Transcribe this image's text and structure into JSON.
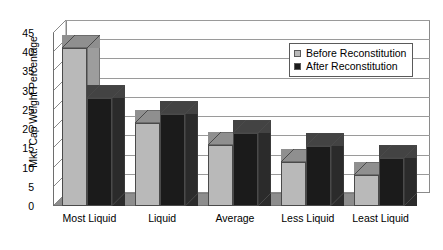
{
  "chart_data": {
    "type": "bar",
    "title": "",
    "subtitle": "",
    "xlabel": "",
    "ylabel": "Mkt. Cap Weight Percentage",
    "categories": [
      "Most Liquid",
      "Liquid",
      "Average",
      "Less Liquid",
      "Least Liquid"
    ],
    "series": [
      {
        "name": "Before Reconstitution",
        "color": "#b9b9b9",
        "values": [
          41,
          21.5,
          16,
          11.5,
          8
        ]
      },
      {
        "name": "After Reconstitution",
        "color": "#1b1b1b",
        "values": [
          28,
          24,
          19,
          15.5,
          12.5
        ]
      }
    ],
    "ylim": [
      0,
      45
    ],
    "ytick_step": 5,
    "yticks": [
      "0",
      "5",
      "10",
      "15",
      "20",
      "25",
      "30",
      "35",
      "40",
      "45"
    ],
    "grid": true,
    "grid_axis": "y",
    "legend_position": "top-right",
    "style": "3d-column"
  },
  "legend": {
    "items": [
      {
        "label": "Before Reconstitution",
        "swatch": "#b9b9b9"
      },
      {
        "label": "After Reconstitution",
        "swatch": "#1b1b1b"
      }
    ]
  }
}
